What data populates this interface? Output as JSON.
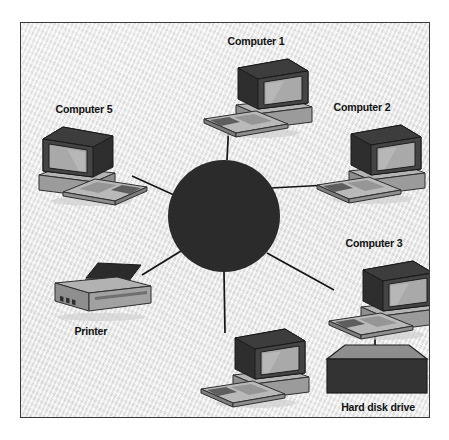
{
  "figure": {
    "type": "star-network-topology-diagram",
    "canvas": {
      "width": 449,
      "height": 440
    },
    "frame": {
      "left": 20,
      "top": 22,
      "width": 410,
      "height": 396,
      "border_color": "#3a3a3a",
      "background": "#eeeeee"
    }
  },
  "hub": {
    "name": "central-hub",
    "shape": "filled-circle",
    "center_x": 223,
    "center_y": 215,
    "radius": 56,
    "color": "#2b2b2b"
  },
  "palette": {
    "ink": "#111111",
    "panel_background": "#eeeeee",
    "frame_border": "#3a3a3a",
    "hub_fill": "#2b2b2b",
    "link_line": "#151515",
    "device_dark": "#2e2e2e",
    "device_mid": "#8c8c8c",
    "device_light": "#bdbdbd",
    "screen_fill": "#a9a9a9"
  },
  "nodes": [
    {
      "id": "computer-1",
      "label": "Computer 1",
      "type": "computer",
      "facing": "left",
      "label_position": "top",
      "x": 195,
      "y": 34,
      "anchor_x": 228,
      "anchor_y": 120
    },
    {
      "id": "computer-2",
      "label": "Computer 2",
      "type": "computer",
      "facing": "left",
      "label_position": "top",
      "x": 318,
      "y": 100,
      "anchor_x": 327,
      "anchor_y": 184
    },
    {
      "id": "computer-3",
      "label": "Computer 3",
      "type": "computer",
      "facing": "left",
      "label_position": "top",
      "x": 336,
      "y": 236,
      "anchor_x": 330,
      "anchor_y": 290
    },
    {
      "id": "computer-4",
      "label": "Computer 4",
      "type": "computer",
      "facing": "left",
      "label_position": "bottom",
      "x": 192,
      "y": 320,
      "anchor_x": 224,
      "anchor_y": 332
    },
    {
      "id": "computer-5",
      "label": "Computer 5",
      "type": "computer",
      "facing": "right",
      "label_position": "top",
      "x": 40,
      "y": 102,
      "anchor_x": 131,
      "anchor_y": 175
    },
    {
      "id": "printer",
      "label": "Printer",
      "type": "printer",
      "label_position": "bottom",
      "x": 48,
      "y": 262,
      "anchor_x": 141,
      "anchor_y": 274
    },
    {
      "id": "hard-disk-drive",
      "label": "Hard disk drive",
      "type": "hard-disk-drive",
      "label_position": "bottom",
      "x": 322,
      "y": 344,
      "anchor_x": 374,
      "anchor_y": 347
    }
  ],
  "links": [
    {
      "id": "link-hub-computer-1",
      "from": "central-hub",
      "to": "computer-1",
      "x1": 226,
      "y1": 159,
      "x2": 228,
      "y2": 120
    },
    {
      "id": "link-hub-computer-2",
      "from": "central-hub",
      "to": "computer-2",
      "x1": 270,
      "y1": 187,
      "x2": 327,
      "y2": 184
    },
    {
      "id": "link-hub-computer-3",
      "from": "central-hub",
      "to": "computer-3",
      "x1": 266,
      "y1": 252,
      "x2": 333,
      "y2": 289
    },
    {
      "id": "link-hub-computer-4",
      "from": "central-hub",
      "to": "computer-4",
      "x1": 223,
      "y1": 271,
      "x2": 224,
      "y2": 332
    },
    {
      "id": "link-hub-printer",
      "from": "central-hub",
      "to": "printer",
      "x1": 180,
      "y1": 250,
      "x2": 141,
      "y2": 274
    },
    {
      "id": "link-hub-computer-5",
      "from": "central-hub",
      "to": "computer-5",
      "x1": 173,
      "y1": 194,
      "x2": 131,
      "y2": 175
    },
    {
      "id": "link-computer-3-hard-disk-drive",
      "from": "computer-3",
      "to": "hard-disk-drive",
      "x1": 374,
      "y1": 312,
      "x2": 374,
      "y2": 347
    }
  ]
}
